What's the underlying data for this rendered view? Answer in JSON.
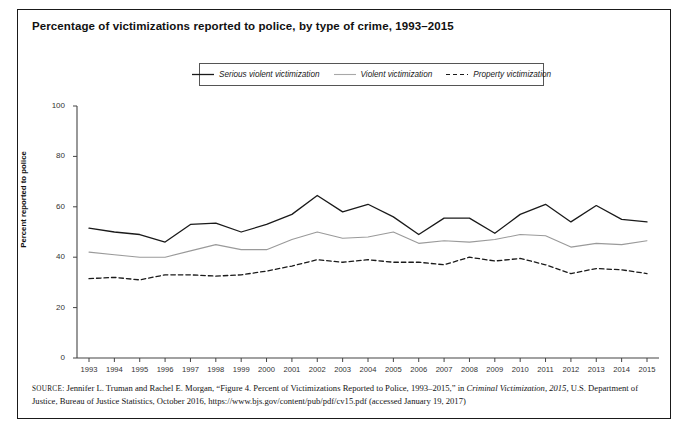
{
  "figure": {
    "title": "Percentage of victimizations reported to police, by type of crime, 1993–2015",
    "y_axis_title": "Percent reported to police"
  },
  "legend": {
    "items": [
      {
        "label": "Serious violent victimization",
        "style": "solid-dark",
        "color": "#1a1a1a",
        "icon": "line-solid-icon"
      },
      {
        "label": "Violent victimization",
        "style": "solid-light",
        "color": "#9a9a9a",
        "icon": "line-solid-light-icon"
      },
      {
        "label": "Property victimization",
        "style": "dashed-dark",
        "color": "#1a1a1a",
        "icon": "line-dashed-icon"
      }
    ]
  },
  "source": {
    "label": "SOURCE:",
    "line1_a": " Jennifer L. Truman and Rachel E. Morgan, “Figure 4. Percent of Victimizations Reported to Police, 1993–2015,” in ",
    "line1_italic": "Criminal Victimization, 2015,",
    "line2": "U.S. Department of Justice, Bureau of Justice Statistics, October 2016, https://www.bjs.gov/content/pub/pdf/cv15.pdf (accessed January 19, 2017)"
  },
  "chart_data": {
    "type": "line",
    "title": "Percentage of victimizations reported to police, by type of crime, 1993–2015",
    "xlabel": "",
    "ylabel": "Percent reported to police",
    "ylim": [
      0,
      100
    ],
    "yticks": [
      0,
      20,
      40,
      60,
      80,
      100
    ],
    "grid": false,
    "legend_position": "top-center",
    "categories": [
      "1993",
      "1994",
      "1995",
      "1996",
      "1997",
      "1998",
      "1999",
      "2000",
      "2001",
      "2002",
      "2003",
      "2004",
      "2005",
      "2006",
      "2007",
      "2008",
      "2009",
      "2010",
      "2011",
      "2012",
      "2013",
      "2014",
      "2015"
    ],
    "series": [
      {
        "name": "Serious violent victimization",
        "color": "#1a1a1a",
        "dash": "solid",
        "values": [
          51.5,
          50.0,
          49.0,
          46.0,
          53.0,
          53.5,
          50.0,
          53.0,
          57.0,
          64.5,
          58.0,
          61.0,
          56.0,
          49.0,
          55.5,
          55.5,
          49.5,
          57.0,
          61.0,
          54.0,
          60.5,
          55.0,
          54.0
        ]
      },
      {
        "name": "Violent victimization",
        "color": "#9a9a9a",
        "dash": "solid",
        "values": [
          42.0,
          41.0,
          40.0,
          40.0,
          42.5,
          45.0,
          43.0,
          43.0,
          47.0,
          50.0,
          47.5,
          48.0,
          50.0,
          45.5,
          46.5,
          46.0,
          47.0,
          49.0,
          48.5,
          44.0,
          45.5,
          45.0,
          46.5
        ]
      },
      {
        "name": "Property victimization",
        "color": "#1a1a1a",
        "dash": "dashed",
        "values": [
          31.5,
          32.0,
          31.0,
          33.0,
          33.0,
          32.5,
          33.0,
          34.5,
          36.5,
          39.0,
          38.0,
          39.0,
          38.0,
          38.0,
          37.0,
          40.0,
          38.5,
          39.5,
          37.0,
          33.5,
          35.5,
          35.0,
          33.5
        ]
      }
    ]
  }
}
